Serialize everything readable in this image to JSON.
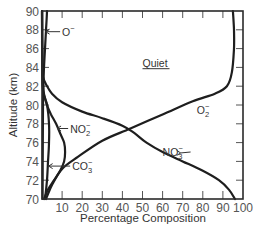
{
  "chart_data": {
    "type": "line",
    "title": "",
    "subtitle": "Quiet",
    "xlabel": "Percentage Composition",
    "ylabel": "Altitude (km)",
    "xlim": [
      0,
      100
    ],
    "ylim": [
      70,
      90
    ],
    "x_ticks": [
      10,
      20,
      30,
      40,
      50,
      60,
      70,
      80,
      90,
      100
    ],
    "y_ticks": [
      70,
      72,
      74,
      76,
      78,
      80,
      82,
      84,
      86,
      88,
      90
    ],
    "grid": false,
    "legend": "inline labels",
    "series": [
      {
        "name": "O⁻",
        "label_main": "O",
        "label_sup": "−",
        "points": [
          [
            0.3,
            70
          ],
          [
            0.4,
            76
          ],
          [
            0.5,
            80
          ],
          [
            0.7,
            82
          ],
          [
            1.0,
            84
          ],
          [
            1.5,
            86
          ],
          [
            2.0,
            88
          ],
          [
            2.5,
            90
          ]
        ]
      },
      {
        "name": "NO₂⁻",
        "label_main": "NO",
        "label_sub": "2",
        "label_sup": "−",
        "points": [
          [
            1,
            70
          ],
          [
            3,
            71
          ],
          [
            6,
            72
          ],
          [
            9,
            73
          ],
          [
            11,
            74
          ],
          [
            11.5,
            75
          ],
          [
            11,
            76
          ],
          [
            9,
            77
          ],
          [
            7,
            78
          ],
          [
            4.5,
            79
          ],
          [
            2.5,
            80
          ],
          [
            1.2,
            81
          ],
          [
            0.5,
            82
          ],
          [
            0.2,
            84
          ],
          [
            0.1,
            90
          ]
        ]
      },
      {
        "name": "CO₃⁻",
        "label_main": "CO",
        "label_sub": "3",
        "label_sup": "−",
        "points": [
          [
            1.5,
            70
          ],
          [
            2.5,
            72
          ],
          [
            3,
            74
          ],
          [
            3.5,
            76
          ],
          [
            3.5,
            78
          ],
          [
            2.5,
            80
          ],
          [
            1,
            81
          ],
          [
            0.3,
            82
          ],
          [
            0.1,
            84
          ],
          [
            0,
            90
          ]
        ]
      },
      {
        "name": "NO₃⁻",
        "label_main": "NO",
        "label_sub": "3",
        "label_sup": "−",
        "points": [
          [
            96,
            70
          ],
          [
            93,
            71
          ],
          [
            88,
            72
          ],
          [
            80,
            73
          ],
          [
            70,
            74
          ],
          [
            60,
            75
          ],
          [
            52,
            76
          ],
          [
            46,
            77
          ],
          [
            40,
            77.8
          ],
          [
            30,
            78.6
          ],
          [
            20,
            79.3
          ],
          [
            10,
            80.3
          ],
          [
            5,
            81.2
          ],
          [
            2,
            82.2
          ],
          [
            0.5,
            83
          ],
          [
            0.2,
            84
          ],
          [
            0,
            90
          ]
        ]
      },
      {
        "name": "O₂⁻",
        "label_main": "O",
        "label_sub": "2",
        "label_sup": "−",
        "points": [
          [
            2,
            70
          ],
          [
            5,
            71.5
          ],
          [
            10,
            73.2
          ],
          [
            18,
            74.5
          ],
          [
            30,
            76.2
          ],
          [
            44,
            77.5
          ],
          [
            60,
            79
          ],
          [
            75,
            80.4
          ],
          [
            86,
            81.2
          ],
          [
            92,
            82
          ],
          [
            94.5,
            83.5
          ],
          [
            95.5,
            86
          ],
          [
            95.5,
            88
          ],
          [
            95,
            90
          ]
        ]
      }
    ],
    "annotations": [
      {
        "text": "Quiet",
        "x": 50,
        "y": 84.5,
        "underline": true
      },
      {
        "text": "O⁻",
        "x": 10,
        "y": 87.8,
        "arrow_to": [
          1.8,
          87.8
        ]
      },
      {
        "text": "NO₂⁻",
        "x": 14,
        "y": 77.5,
        "arrow_to": [
          7.5,
          77.5
        ]
      },
      {
        "text": "CO₃⁻",
        "x": 15,
        "y": 73.5,
        "arrow_to": [
          3.3,
          73.5
        ]
      },
      {
        "text": "NO₃⁻",
        "x": 60,
        "y": 75,
        "arrow_to": [
          69,
          74.9
        ]
      },
      {
        "text": "O₂⁻",
        "x": 77,
        "y": 79.5
      }
    ]
  },
  "labels": {
    "quiet": "Quiet",
    "x_axis": "Percentage Composition",
    "y_axis": "Altitude (km)"
  }
}
